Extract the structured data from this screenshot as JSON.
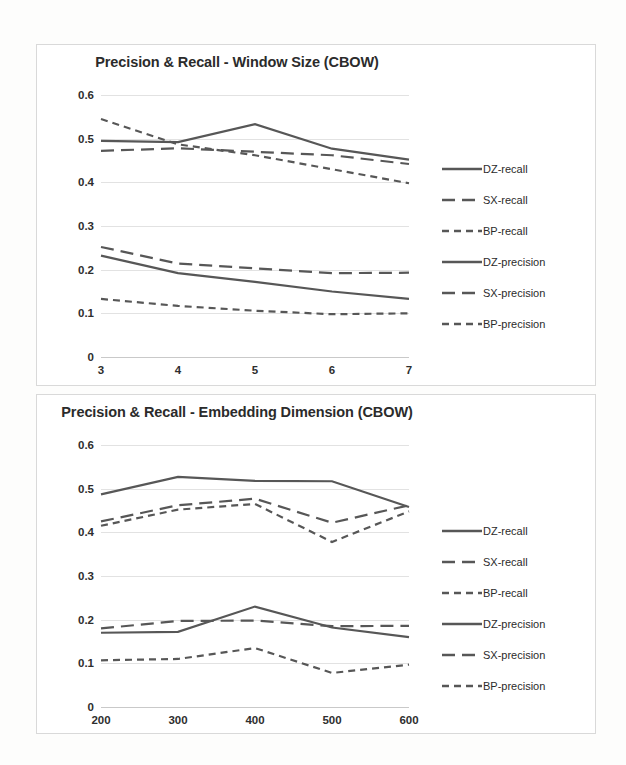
{
  "chart_data": [
    {
      "id": "window-size",
      "type": "line",
      "title": "Precision & Recall - Window Size (CBOW)",
      "xlabel": "",
      "ylabel": "",
      "categories": [
        3,
        4,
        5,
        6,
        7
      ],
      "xticklabels": [
        "3",
        "4",
        "5",
        "6",
        "7"
      ],
      "yticklabels": [
        "0",
        "0.1",
        "0.2",
        "0.3",
        "0.4",
        "0.5",
        "0.6"
      ],
      "yticks": [
        0,
        0.1,
        0.2,
        0.3,
        0.4,
        0.5,
        0.6
      ],
      "ylim": [
        0,
        0.6
      ],
      "grid": true,
      "legend_position": "right",
      "series": [
        {
          "name": "DZ-recall",
          "style": "solid",
          "values": [
            0.495,
            0.492,
            0.533,
            0.477,
            0.452
          ]
        },
        {
          "name": "SX-recall",
          "style": "long-dash",
          "values": [
            0.472,
            0.478,
            0.47,
            0.462,
            0.442
          ]
        },
        {
          "name": "BP-recall",
          "style": "short-dash",
          "values": [
            0.545,
            0.487,
            0.462,
            0.43,
            0.398
          ]
        },
        {
          "name": "DZ-precision",
          "style": "solid",
          "values": [
            0.232,
            0.192,
            0.172,
            0.15,
            0.133
          ]
        },
        {
          "name": "SX-precision",
          "style": "long-dash",
          "values": [
            0.252,
            0.214,
            0.203,
            0.192,
            0.193
          ]
        },
        {
          "name": "BP-precision",
          "style": "short-dash",
          "values": [
            0.133,
            0.117,
            0.106,
            0.098,
            0.1
          ]
        }
      ]
    },
    {
      "id": "embedding-dimension",
      "type": "line",
      "title": "Precision & Recall - Embedding Dimension (CBOW)",
      "xlabel": "",
      "ylabel": "",
      "categories": [
        200,
        300,
        400,
        500,
        600
      ],
      "xticklabels": [
        "200",
        "300",
        "400",
        "500",
        "600"
      ],
      "yticklabels": [
        "0",
        "0.1",
        "0.2",
        "0.3",
        "0.4",
        "0.5",
        "0.6"
      ],
      "yticks": [
        0,
        0.1,
        0.2,
        0.3,
        0.4,
        0.5,
        0.6
      ],
      "ylim": [
        0,
        0.6
      ],
      "grid": true,
      "legend_position": "right",
      "series": [
        {
          "name": "DZ-recall",
          "style": "solid",
          "values": [
            0.487,
            0.527,
            0.518,
            0.517,
            0.458
          ]
        },
        {
          "name": "SX-recall",
          "style": "long-dash",
          "values": [
            0.425,
            0.462,
            0.477,
            0.422,
            0.462
          ]
        },
        {
          "name": "BP-recall",
          "style": "short-dash",
          "values": [
            0.415,
            0.452,
            0.465,
            0.378,
            0.448
          ]
        },
        {
          "name": "DZ-precision",
          "style": "solid",
          "values": [
            0.17,
            0.172,
            0.23,
            0.182,
            0.16
          ]
        },
        {
          "name": "SX-precision",
          "style": "long-dash",
          "values": [
            0.18,
            0.197,
            0.198,
            0.185,
            0.186
          ]
        },
        {
          "name": "BP-precision",
          "style": "short-dash",
          "values": [
            0.107,
            0.11,
            0.135,
            0.078,
            0.097
          ]
        }
      ]
    }
  ],
  "colors": {
    "line": "#575757",
    "grid": "#e2e2e2",
    "text": "#2b2b2b",
    "panel_border": "#d9d9d9",
    "background": "#ffffff"
  }
}
